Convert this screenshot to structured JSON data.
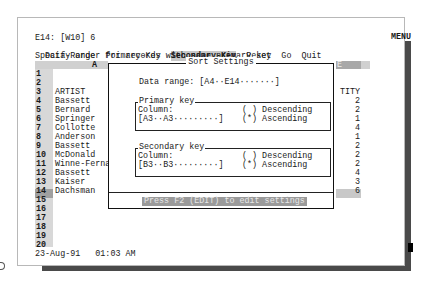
{
  "status_line": {
    "cell_ref": "E14: [W10] 6",
    "mode_indicator": "MENU"
  },
  "menu": {
    "items": [
      {
        "label": "Data-Range",
        "selected": false
      },
      {
        "label": "Primary-Key",
        "selected": false
      },
      {
        "label": "Secondary-Key",
        "selected": true
      },
      {
        "label": "Reset",
        "selected": false
      },
      {
        "label": "Go",
        "selected": false
      },
      {
        "label": "Quit",
        "selected": false
      }
    ],
    "description": "Specify order for records with same primary key"
  },
  "sheet": {
    "col_a_header": "A",
    "col_e_header": "E",
    "rows": [
      {
        "num": "1",
        "a": "",
        "e": ""
      },
      {
        "num": "2",
        "a": "",
        "e": ""
      },
      {
        "num": "3",
        "a": "ARTIST",
        "e": "TITY"
      },
      {
        "num": "4",
        "a": "Bassett",
        "e": "2"
      },
      {
        "num": "5",
        "a": "Bernard",
        "e": "2"
      },
      {
        "num": "6",
        "a": "Springer",
        "e": "1"
      },
      {
        "num": "7",
        "a": "Collotte",
        "e": "4"
      },
      {
        "num": "8",
        "a": "Anderson",
        "e": "1"
      },
      {
        "num": "9",
        "a": "Bassett",
        "e": "2"
      },
      {
        "num": "10",
        "a": "McDonald",
        "e": "2"
      },
      {
        "num": "11",
        "a": "Winne-Ferna",
        "e": "2"
      },
      {
        "num": "12",
        "a": "Bassett",
        "e": "4"
      },
      {
        "num": "13",
        "a": "Kaiser",
        "e": "3"
      },
      {
        "num": "14",
        "a": "Dachsman",
        "e": "6"
      },
      {
        "num": "15",
        "a": "",
        "e": ""
      },
      {
        "num": "16",
        "a": "",
        "e": ""
      },
      {
        "num": "17",
        "a": "",
        "e": ""
      },
      {
        "num": "18",
        "a": "",
        "e": ""
      },
      {
        "num": "19",
        "a": "",
        "e": ""
      },
      {
        "num": "20",
        "a": "",
        "e": ""
      }
    ],
    "footer_datetime": "23-Aug-91   01:03 AM"
  },
  "dialog": {
    "title": "Sort Settings",
    "data_range_label": "Data range:",
    "data_range_value": "[A4··E14·······]",
    "primary": {
      "legend": "Primary key",
      "column_label": "Column:",
      "column_value": "[A3··A3·········]",
      "descending": "( ) Descending",
      "ascending": "(*) Ascending"
    },
    "secondary": {
      "legend": "Secondary key",
      "column_label": "Column:",
      "column_value": "[B3··B3·········]",
      "descending": "( ) Descending",
      "ascending": "(*) Ascending"
    },
    "hint": "Press F2 (EDIT) to edit settings"
  }
}
